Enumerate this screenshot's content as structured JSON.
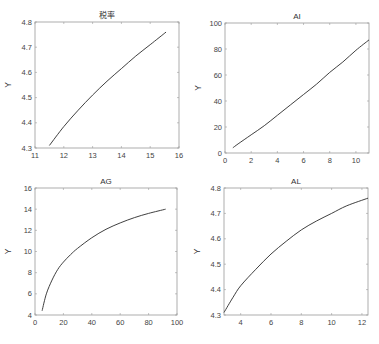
{
  "figure": {
    "caption": ""
  },
  "chart_data": [
    {
      "type": "line",
      "title": "税率",
      "xlabel": "",
      "ylabel": "Y",
      "xlim": [
        11,
        16
      ],
      "ylim": [
        4.3,
        4.8
      ],
      "xticks": [
        11,
        12,
        13,
        14,
        15,
        16
      ],
      "yticks": [
        4.3,
        4.4,
        4.5,
        4.6,
        4.7,
        4.8
      ],
      "x": [
        11.5,
        12.0,
        12.5,
        13.0,
        13.5,
        14.0,
        14.5,
        15.0,
        15.55
      ],
      "y": [
        4.31,
        4.385,
        4.45,
        4.51,
        4.565,
        4.615,
        4.665,
        4.71,
        4.76
      ],
      "grid": false,
      "frame": {
        "left": 35,
        "top": 22,
        "right": 179,
        "bottom": 148
      }
    },
    {
      "type": "line",
      "title": "AI",
      "xlabel": "",
      "ylabel": "Y",
      "xlim": [
        0,
        11
      ],
      "ylim": [
        0,
        100
      ],
      "xticks": [
        0,
        2,
        4,
        6,
        8,
        10
      ],
      "yticks": [
        0,
        20,
        40,
        60,
        80,
        100
      ],
      "x": [
        0.6,
        1,
        2,
        3,
        4,
        5,
        6,
        7,
        8,
        9,
        10,
        11
      ],
      "y": [
        4,
        7,
        14,
        21,
        29,
        37,
        45,
        53,
        62,
        70,
        79,
        87
      ],
      "grid": false,
      "frame": {
        "left": 225,
        "top": 23,
        "right": 369,
        "bottom": 153
      }
    },
    {
      "type": "line",
      "title": "AG",
      "xlabel": "",
      "ylabel": "Y",
      "xlim": [
        0,
        100
      ],
      "ylim": [
        4,
        16
      ],
      "xticks": [
        0,
        20,
        40,
        60,
        80,
        100
      ],
      "yticks": [
        4,
        6,
        8,
        10,
        12,
        14,
        16
      ],
      "x": [
        5,
        8,
        12,
        16,
        20,
        25,
        30,
        40,
        50,
        60,
        70,
        80,
        92
      ],
      "y": [
        4.4,
        6.0,
        7.3,
        8.3,
        9.0,
        9.7,
        10.3,
        11.3,
        12.1,
        12.7,
        13.2,
        13.6,
        14.0
      ],
      "grid": false,
      "frame": {
        "left": 35,
        "top": 188,
        "right": 177,
        "bottom": 315
      }
    },
    {
      "type": "line",
      "title": "AL",
      "xlabel": "",
      "ylabel": "Y",
      "xlim": [
        2.9,
        12.4
      ],
      "ylim": [
        4.3,
        4.8
      ],
      "xticks": [
        4,
        6,
        8,
        10,
        12
      ],
      "yticks": [
        4.3,
        4.4,
        4.5,
        4.6,
        4.7,
        4.8
      ],
      "x": [
        2.9,
        3.5,
        4,
        5,
        6,
        7,
        8,
        9,
        10,
        11,
        12.4
      ],
      "y": [
        4.31,
        4.37,
        4.415,
        4.48,
        4.54,
        4.59,
        4.635,
        4.67,
        4.7,
        4.73,
        4.76
      ],
      "grid": false,
      "frame": {
        "left": 224,
        "top": 188,
        "right": 368,
        "bottom": 315
      }
    }
  ]
}
